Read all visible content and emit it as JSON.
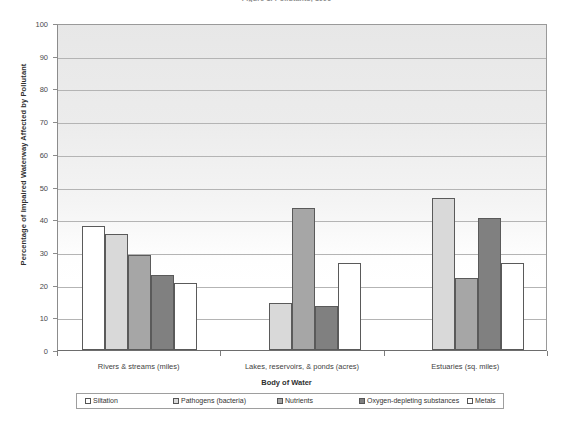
{
  "chart_data": {
    "type": "bar",
    "title": "Figure 1. Pollutants, 1996",
    "xlabel": "Body of Water",
    "ylabel": "Percentage of Impaired Waterway Affected by Pollutant",
    "categories": [
      "Rivers & streams (miles)",
      "Lakes, reservoirs, & ponds (acres)",
      "Estuaries (sq. miles)"
    ],
    "series": [
      {
        "name": "Siltation",
        "color": "#ffffff",
        "values": [
          38,
          0,
          0
        ]
      },
      {
        "name": "Pathogens (bacteria)",
        "color": "#d9d9d9",
        "values": [
          35.5,
          14.5,
          46.5
        ]
      },
      {
        "name": "Nutrients",
        "color": "#a6a6a6",
        "values": [
          29,
          43.5,
          22
        ]
      },
      {
        "name": "Oxygen-depleting substances",
        "color": "#808080",
        "values": [
          23,
          13.5,
          40.5
        ]
      },
      {
        "name": "Metals",
        "color": "#ffffff",
        "values": [
          20.5,
          26.5,
          26.5
        ]
      }
    ],
    "ylim": [
      0,
      100
    ],
    "yticks": [
      0,
      10,
      20,
      30,
      40,
      50,
      60,
      70,
      80,
      90,
      100
    ],
    "ytick_labels": [
      "0",
      "10",
      "20",
      "30",
      "40",
      "50",
      "60",
      "70",
      "80",
      "90",
      "100"
    ],
    "grid": true,
    "legend_position": "bottom"
  }
}
